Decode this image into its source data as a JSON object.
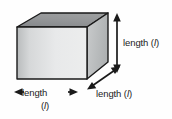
{
  "figure": {
    "name": "cube-dimensions-diagram",
    "background_color": "#fefefe"
  },
  "shape": {
    "name": "cube",
    "type": "3d-box",
    "faces": {
      "front": {
        "name": "front-face",
        "fill_light": "#eceded",
        "fill_dark": "#b9bcbd"
      },
      "top": {
        "name": "top-face",
        "fill_light": "#9b9d9e",
        "fill_dark": "#84878a"
      },
      "right": {
        "name": "right-face",
        "fill_light": "#c9cbcc",
        "fill_dark": "#aeb1b2"
      }
    },
    "outline_color": "#1a1a1a"
  },
  "dimensions": {
    "height": {
      "label_text": "length (",
      "symbol": "l",
      "label_close": ")",
      "arrow": "double-headed-vertical-arrow"
    },
    "depth": {
      "label_text": "length (",
      "symbol": "l",
      "label_close": ")",
      "arrow": "double-headed-diagonal-arrow"
    },
    "width": {
      "label_text": "length",
      "symbol": "l",
      "label_open": "(",
      "label_close": ")",
      "arrow": "double-headed-horizontal-arrow"
    }
  },
  "arrow_color": "#1a1a1a"
}
